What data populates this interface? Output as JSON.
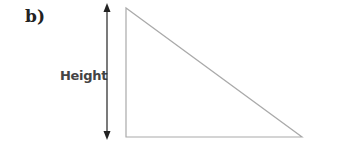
{
  "part_label": "b)",
  "dimension_label": "Height",
  "shape": {
    "type": "right-triangle",
    "vertices": [
      [
        126,
        8
      ],
      [
        126,
        137
      ],
      [
        302,
        137
      ]
    ],
    "stroke_color": "#aaaaaa"
  },
  "arrow": {
    "type": "double-headed-vertical",
    "x": 107,
    "y1": 4,
    "y2": 139,
    "color": "#222222"
  }
}
